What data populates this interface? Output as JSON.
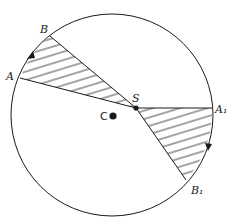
{
  "diagram": {
    "type": "geometry",
    "colors": {
      "stroke": "#1a1a1a",
      "background": "#ffffff",
      "hatch": "#1a1a1a"
    },
    "circle": {
      "cx": 112,
      "cy": 115,
      "r": 101
    },
    "points": {
      "C": {
        "label": "C",
        "x": 113,
        "y": 116
      },
      "S": {
        "label": "S",
        "x": 136,
        "y": 108
      },
      "A": {
        "label": "A",
        "x": 20,
        "y": 78
      },
      "B": {
        "label": "B",
        "x": 50,
        "y": 36
      },
      "A1": {
        "label": "A₁",
        "x": 212,
        "y": 108
      },
      "B1": {
        "label": "B₁",
        "x": 186,
        "y": 180
      }
    },
    "labels": {
      "A": "A",
      "B": "B",
      "S": "S",
      "C": "C",
      "A1": "A₁",
      "B1": "B₁"
    },
    "regions": [
      {
        "name": "shaded-region-ABS",
        "vertices": [
          "S",
          "A",
          "B"
        ],
        "fill": "hatched"
      },
      {
        "name": "shaded-region-A1B1S",
        "vertices": [
          "S",
          "A1",
          "B1"
        ],
        "fill": "hatched"
      }
    ],
    "arrows": [
      {
        "name": "arrow-arc-AB",
        "on_arc": "A→B"
      },
      {
        "name": "arrow-arc-A1B1",
        "on_arc": "A₁→B₁"
      }
    ]
  }
}
